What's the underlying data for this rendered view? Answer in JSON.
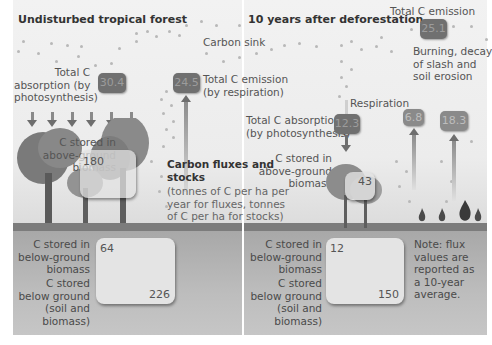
{
  "left_panel": {
    "title": "Undisturbed tropical forest",
    "absorption_label": [
      "Total C",
      "absorption (by",
      "photosynthesis)"
    ],
    "absorption_value": "30.4",
    "emission_value": "24.5",
    "emission_label": [
      "Total C emission",
      "(by respiration)"
    ],
    "above_ground_label": [
      "C stored in",
      "above-ground",
      "biomass"
    ],
    "above_ground_value": "180",
    "below_biomass_label": [
      "C stored in",
      "below-ground",
      "biomass"
    ],
    "below_biomass_value": "64",
    "below_total_label": [
      "C stored",
      "below ground",
      "(soil and",
      "biomass)"
    ],
    "below_total_value": "226"
  },
  "center": {
    "carbon_sink_label": "Carbon sink",
    "legend_title": [
      "Carbon fluxes and",
      "stocks"
    ],
    "legend_body": [
      "(tonnes of C per ha per",
      "year for fluxes, tonnes",
      "of C per ha for stocks)"
    ]
  },
  "right_panel": {
    "title": "10 years after deforestation",
    "total_emission_label": "Total C emission",
    "total_emission_value": "25.1",
    "burning_label": [
      "Burning, decay",
      "of slash and",
      "soil erosion"
    ],
    "respiration_label": "Respiration",
    "respiration_value": "6.8",
    "burning_value": "18.3",
    "absorption_label": [
      "Total C absorption",
      "(by photosynthesis)"
    ],
    "absorption_value": "12.3",
    "above_ground_label": [
      "C stored in",
      "above-ground",
      "biomass"
    ],
    "above_ground_value": "43",
    "below_biomass_label": [
      "C stored in",
      "below-ground",
      "biomass"
    ],
    "below_biomass_value": "12",
    "below_total_label": [
      "C stored",
      "below ground",
      "(soil and",
      "biomass)"
    ],
    "below_total_value": "150",
    "note": [
      "Note: flux",
      "values are",
      "reported as",
      "a 10-year",
      "average."
    ]
  },
  "colors": {
    "value_box": "#707070",
    "ground": "#a8a8a8",
    "ground_line": "#7c7c7c",
    "sky": "#f2f2f2"
  }
}
